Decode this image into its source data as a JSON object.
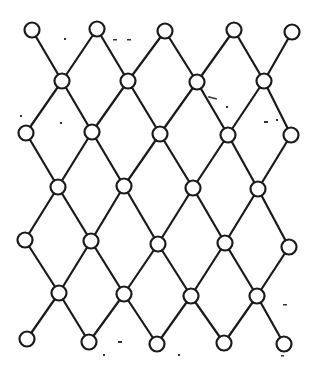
{
  "diagram": {
    "type": "lattice",
    "colors": {
      "stroke": "#1a1a1a",
      "node_fill": "#ffffff",
      "background": "#ffffff"
    },
    "node_radius": 7.5,
    "nodes": [
      {
        "id": "r1c1",
        "x": 32,
        "y": 30
      },
      {
        "id": "r1c2",
        "x": 97,
        "y": 29
      },
      {
        "id": "r1c3",
        "x": 165,
        "y": 31
      },
      {
        "id": "r1c4",
        "x": 234,
        "y": 30
      },
      {
        "id": "r1c5",
        "x": 292,
        "y": 32
      },
      {
        "id": "r2c1",
        "x": 62,
        "y": 81
      },
      {
        "id": "r2c2",
        "x": 128,
        "y": 81
      },
      {
        "id": "r2c3",
        "x": 197,
        "y": 82
      },
      {
        "id": "r2c4",
        "x": 264,
        "y": 81
      },
      {
        "id": "r3c1",
        "x": 26,
        "y": 133
      },
      {
        "id": "r3c2",
        "x": 92,
        "y": 132
      },
      {
        "id": "r3c3",
        "x": 160,
        "y": 134
      },
      {
        "id": "r3c4",
        "x": 228,
        "y": 135
      },
      {
        "id": "r3c5",
        "x": 291,
        "y": 135
      },
      {
        "id": "r4c1",
        "x": 58,
        "y": 187
      },
      {
        "id": "r4c2",
        "x": 124,
        "y": 186
      },
      {
        "id": "r4c3",
        "x": 193,
        "y": 188
      },
      {
        "id": "r4c4",
        "x": 258,
        "y": 189
      },
      {
        "id": "r5c1",
        "x": 25,
        "y": 240
      },
      {
        "id": "r5c2",
        "x": 91,
        "y": 241
      },
      {
        "id": "r5c3",
        "x": 158,
        "y": 244
      },
      {
        "id": "r5c4",
        "x": 225,
        "y": 243
      },
      {
        "id": "r5c5",
        "x": 289,
        "y": 247
      },
      {
        "id": "r6c1",
        "x": 59,
        "y": 293
      },
      {
        "id": "r6c2",
        "x": 124,
        "y": 294
      },
      {
        "id": "r6c3",
        "x": 191,
        "y": 296
      },
      {
        "id": "r6c4",
        "x": 257,
        "y": 296
      },
      {
        "id": "r7c1",
        "x": 27,
        "y": 339
      },
      {
        "id": "r7c2",
        "x": 89,
        "y": 342
      },
      {
        "id": "r7c3",
        "x": 157,
        "y": 344
      },
      {
        "id": "r7c4",
        "x": 224,
        "y": 343
      },
      {
        "id": "r7c5",
        "x": 284,
        "y": 344
      }
    ],
    "edges": [
      [
        "r1c1",
        "r2c1"
      ],
      [
        "r1c2",
        "r2c1"
      ],
      [
        "r1c2",
        "r2c2"
      ],
      [
        "r1c3",
        "r2c2"
      ],
      [
        "r1c3",
        "r2c3"
      ],
      [
        "r1c4",
        "r2c3"
      ],
      [
        "r1c4",
        "r2c4"
      ],
      [
        "r1c5",
        "r2c4"
      ],
      [
        "r2c1",
        "r3c1"
      ],
      [
        "r2c1",
        "r3c2"
      ],
      [
        "r2c2",
        "r3c2"
      ],
      [
        "r2c2",
        "r3c3"
      ],
      [
        "r2c3",
        "r3c3"
      ],
      [
        "r2c3",
        "r3c4"
      ],
      [
        "r2c4",
        "r3c4"
      ],
      [
        "r2c4",
        "r3c5"
      ],
      [
        "r3c1",
        "r4c1"
      ],
      [
        "r3c2",
        "r4c1"
      ],
      [
        "r3c2",
        "r4c2"
      ],
      [
        "r3c3",
        "r4c2"
      ],
      [
        "r3c3",
        "r4c3"
      ],
      [
        "r3c4",
        "r4c3"
      ],
      [
        "r3c4",
        "r4c4"
      ],
      [
        "r3c5",
        "r4c4"
      ],
      [
        "r4c1",
        "r5c1"
      ],
      [
        "r4c1",
        "r5c2"
      ],
      [
        "r4c2",
        "r5c2"
      ],
      [
        "r4c2",
        "r5c3"
      ],
      [
        "r4c3",
        "r5c3"
      ],
      [
        "r4c3",
        "r5c4"
      ],
      [
        "r4c4",
        "r5c4"
      ],
      [
        "r4c4",
        "r5c5"
      ],
      [
        "r5c1",
        "r6c1"
      ],
      [
        "r5c2",
        "r6c1"
      ],
      [
        "r5c2",
        "r6c2"
      ],
      [
        "r5c3",
        "r6c2"
      ],
      [
        "r5c3",
        "r6c3"
      ],
      [
        "r5c4",
        "r6c3"
      ],
      [
        "r5c4",
        "r6c4"
      ],
      [
        "r5c5",
        "r6c4"
      ],
      [
        "r6c1",
        "r7c1"
      ],
      [
        "r6c1",
        "r7c2"
      ],
      [
        "r6c2",
        "r7c2"
      ],
      [
        "r6c2",
        "r7c3"
      ],
      [
        "r6c3",
        "r7c3"
      ],
      [
        "r6c3",
        "r7c4"
      ],
      [
        "r6c4",
        "r7c4"
      ],
      [
        "r6c4",
        "r7c5"
      ]
    ]
  }
}
